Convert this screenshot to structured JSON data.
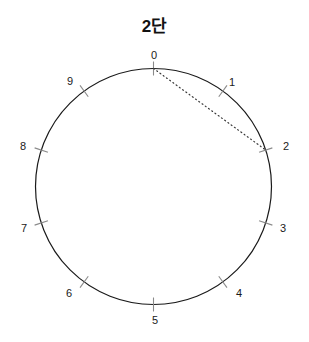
{
  "figure": {
    "title": "2단",
    "type": "modular-multiplication-circle",
    "background_color": "#ffffff"
  },
  "chart_data": {
    "type": "scatter",
    "title": "2단",
    "xlabel": "",
    "ylabel": "",
    "modulus": 10,
    "multiplier": 2,
    "circle": {
      "center_x": 153.5,
      "center_y": 186.5,
      "radius": 118,
      "stroke_color": "#1a1a1a",
      "stroke_width": 1.2
    },
    "tick": {
      "color": "#8a8a8a",
      "inner_offset": 7,
      "outer_offset": 7,
      "width": 1.1
    },
    "grid": false,
    "legend": null,
    "categories": [
      "0",
      "1",
      "2",
      "3",
      "4",
      "5",
      "6",
      "7",
      "8",
      "9"
    ],
    "values": [
      0,
      1,
      2,
      3,
      4,
      5,
      6,
      7,
      8,
      9
    ],
    "points": [
      {
        "label": "0",
        "index": 0,
        "angle_deg": 0,
        "cx": 153.5,
        "cy": 68.5,
        "label_x": 154,
        "label_y": 55
      },
      {
        "label": "1",
        "index": 1,
        "angle_deg": 36,
        "cx": 222.8,
        "cy": 91.0,
        "label_x": 232,
        "label_y": 82
      },
      {
        "label": "2",
        "index": 2,
        "angle_deg": 72,
        "cx": 265.7,
        "cy": 150.0,
        "label_x": 286,
        "label_y": 146
      },
      {
        "label": "3",
        "index": 3,
        "angle_deg": 108,
        "cx": 265.7,
        "cy": 223.0,
        "label_x": 283,
        "label_y": 228
      },
      {
        "label": "4",
        "index": 4,
        "angle_deg": 144,
        "cx": 222.8,
        "cy": 282.0,
        "label_x": 239,
        "label_y": 293
      },
      {
        "label": "5",
        "index": 5,
        "angle_deg": 180,
        "cx": 153.5,
        "cy": 304.5,
        "label_x": 155,
        "label_y": 320
      },
      {
        "label": "6",
        "index": 6,
        "angle_deg": 216,
        "cx": 84.2,
        "cy": 282.0,
        "label_x": 69,
        "label_y": 293
      },
      {
        "label": "7",
        "index": 7,
        "angle_deg": 252,
        "cx": 41.3,
        "cy": 223.0,
        "label_x": 24,
        "label_y": 228
      },
      {
        "label": "8",
        "index": 8,
        "angle_deg": 288,
        "cx": 41.3,
        "cy": 150.0,
        "label_x": 23,
        "label_y": 146
      },
      {
        "label": "9",
        "index": 9,
        "angle_deg": 324,
        "cx": 84.2,
        "cy": 91.0,
        "label_x": 70,
        "label_y": 81
      }
    ],
    "chords": [
      {
        "from": "0",
        "to": "2",
        "x1": 153.5,
        "y1": 68.5,
        "x2": 265.7,
        "y2": 150.0,
        "style": "dotted",
        "color": "#3a3a3a",
        "width": 1.2
      }
    ]
  }
}
